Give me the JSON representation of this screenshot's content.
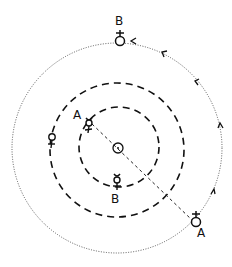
{
  "diagram": {
    "type": "orbital-diagram",
    "center_symbol": "sun",
    "orbits": [
      {
        "name": "mercury-orbit",
        "style": "dashed",
        "radius": 40
      },
      {
        "name": "venus-orbit",
        "style": "dashed",
        "radius": 66
      },
      {
        "name": "earth-orbit",
        "style": "dotted",
        "radius": 105
      }
    ],
    "bodies": [
      {
        "name": "sun",
        "glyph": "☉"
      },
      {
        "name": "mercury-A",
        "glyph": "☿",
        "label": "A"
      },
      {
        "name": "mercury-B",
        "glyph": "☿",
        "label": "B"
      },
      {
        "name": "venus",
        "glyph": "♀"
      },
      {
        "name": "earth-A",
        "glyph": "♁",
        "label": "A"
      },
      {
        "name": "earth-B",
        "glyph": "♁",
        "label": "B"
      }
    ],
    "labels": {
      "earth_b": "B",
      "mercury_a": "A",
      "mercury_b": "B",
      "earth_a": "A"
    },
    "direction": "counter-clockwise",
    "colors": {
      "ink": "#111111",
      "background": "#ffffff"
    }
  }
}
